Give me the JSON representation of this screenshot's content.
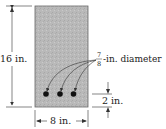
{
  "diagram": {
    "type": "beam-cross-section",
    "height_label": "16 in.",
    "width_label": "8 in.",
    "cover_label": "2 in.",
    "bar_diameter": {
      "numerator": "7",
      "denominator": "8",
      "suffix": "-in. diameter"
    },
    "bar_count": 3,
    "colors": {
      "concrete": "#b8b8b8",
      "outline": "#555555",
      "bars": "#111111",
      "lines": "#333333"
    }
  }
}
